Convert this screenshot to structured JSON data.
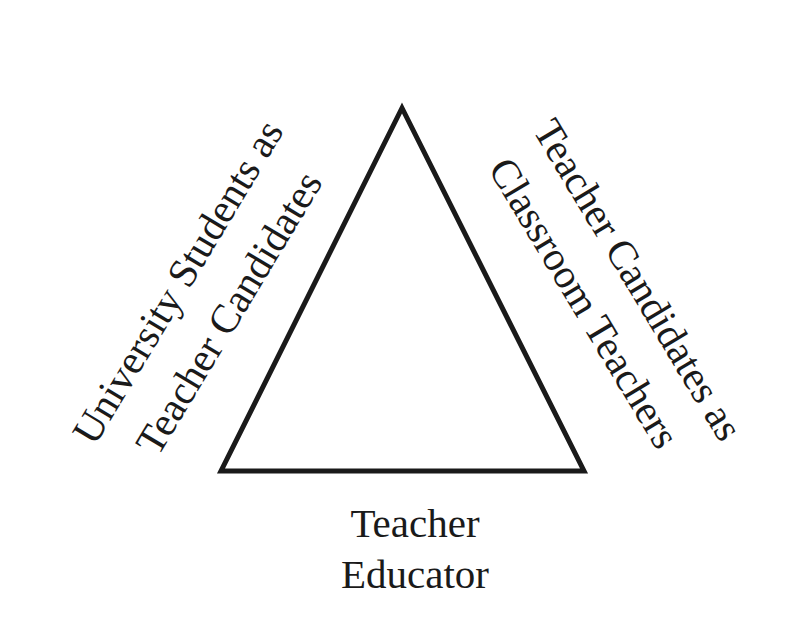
{
  "diagram": {
    "type": "triangle",
    "stroke_color": "#1a1a1a",
    "background": "#ffffff",
    "vertices": {
      "apex": [
        402,
        108
      ],
      "bottom_left": [
        221,
        471
      ],
      "bottom_right": [
        584,
        471
      ]
    },
    "left_side_label": {
      "line1": "University Students as",
      "line2": "Teacher Candidates"
    },
    "right_side_label": {
      "line1": "Teacher Candidates as",
      "line2": "Classroom Teachers"
    },
    "bottom_label": {
      "line1": "Teacher",
      "line2": "Educator"
    }
  }
}
